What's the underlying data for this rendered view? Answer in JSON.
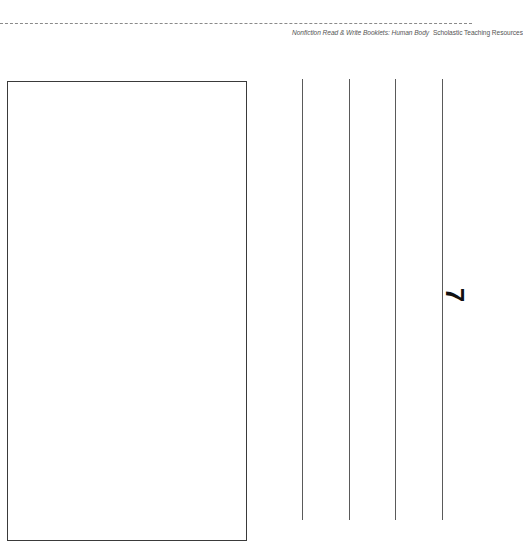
{
  "header": {
    "credit_title": "Nonfiction Read & Write Booklets: Human Body",
    "credit_publisher": "Scholastic Teaching Resources"
  },
  "page": {
    "page_number": "7",
    "picture_box": "blank drawing area",
    "writing_lines_count": 4
  },
  "colors": {
    "rule": "#8a8a8a",
    "box_border": "#3a3a3a",
    "lines": "#5a5a5a",
    "text": "#555555"
  }
}
